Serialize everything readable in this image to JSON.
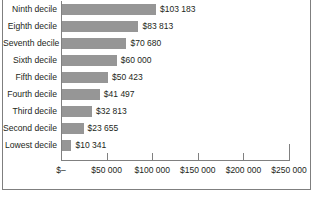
{
  "chart_data": {
    "type": "bar",
    "orientation": "horizontal",
    "title": "",
    "subtitle": "",
    "xlabel": "",
    "ylabel": "",
    "xlim": [
      0,
      250000
    ],
    "grid": false,
    "legend": null,
    "bar_color": "#969696",
    "axis_color": "#808080",
    "text_color": "#231f20",
    "categories": [
      "Ninth decile",
      "Eighth decile",
      "Seventh decile",
      "Sixth decile",
      "Fifth decile",
      "Fourth decile",
      "Third decile",
      "Second decile",
      "Lowest decile"
    ],
    "values": [
      103183,
      83813,
      70680,
      60000,
      50423,
      41497,
      32813,
      23655,
      10341
    ],
    "value_labels": [
      "$103 183",
      "$83 813",
      "$70 680",
      "$60 000",
      "$50 423",
      "$41 497",
      "$32 813",
      "$23 655",
      "$10 341"
    ],
    "xticks": [
      0,
      50000,
      100000,
      150000,
      200000,
      250000
    ],
    "xtick_labels": [
      "$–",
      "$50 000",
      "$100 000",
      "$150 000",
      "$200 000",
      "$250 000"
    ]
  }
}
